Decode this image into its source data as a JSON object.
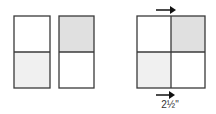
{
  "colors": {
    "stroke": "#3a3a3a",
    "shaded": "#e0e0e0",
    "light": "#f0f0f0",
    "white": "#ffffff"
  },
  "diagram": {
    "left_rect_1": {
      "top": "white",
      "bottom": "light"
    },
    "left_rect_2": {
      "top": "shaded",
      "bottom": "white"
    },
    "square": {
      "top_left": "white",
      "top_right": "shaded",
      "bottom_left": "light",
      "bottom_right": "white"
    },
    "arrows": [
      "top-right-arrow",
      "bottom-right-arrow"
    ],
    "measurement_label": "2½\""
  }
}
